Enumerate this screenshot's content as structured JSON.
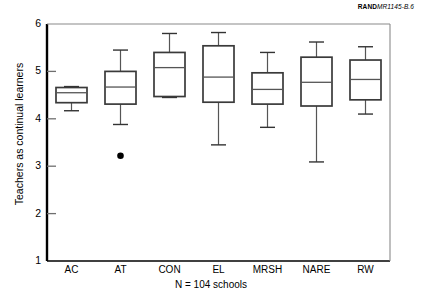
{
  "credit": {
    "brand": "RAND",
    "code": "MR1145-B.6"
  },
  "caption": "N = 104 schools",
  "chart_data": {
    "type": "box",
    "title": "",
    "xlabel": "",
    "ylabel": "Teachers as continual learners",
    "ylim": [
      1,
      6
    ],
    "yticks": [
      1,
      2,
      3,
      4,
      5,
      6
    ],
    "ytick_labels": [
      "1",
      "2",
      "3",
      "4",
      "5",
      "6"
    ],
    "grid": false,
    "legend": null,
    "categories": [
      "AC",
      "AT",
      "CON",
      "EL",
      "MRSH",
      "NARE",
      "RW"
    ],
    "boxes": [
      {
        "category": "AC",
        "whisker_low": 4.17,
        "q1": 4.34,
        "median": 4.55,
        "q3": 4.66,
        "whisker_high": 4.68,
        "outliers": []
      },
      {
        "category": "AT",
        "whisker_low": 3.88,
        "q1": 4.31,
        "median": 4.67,
        "q3": 5.0,
        "whisker_high": 5.45,
        "outliers": [
          3.22
        ]
      },
      {
        "category": "CON",
        "whisker_low": 4.45,
        "q1": 4.47,
        "median": 5.08,
        "q3": 5.4,
        "whisker_high": 5.8,
        "outliers": []
      },
      {
        "category": "EL",
        "whisker_low": 3.45,
        "q1": 4.35,
        "median": 4.88,
        "q3": 5.54,
        "whisker_high": 5.82,
        "outliers": []
      },
      {
        "category": "MRSH",
        "whisker_low": 3.82,
        "q1": 4.31,
        "median": 4.62,
        "q3": 4.97,
        "whisker_high": 5.4,
        "outliers": []
      },
      {
        "category": "NARE",
        "whisker_low": 3.09,
        "q1": 4.27,
        "median": 4.77,
        "q3": 5.3,
        "whisker_high": 5.62,
        "outliers": []
      },
      {
        "category": "RW",
        "whisker_low": 4.1,
        "q1": 4.4,
        "median": 4.83,
        "q3": 5.24,
        "whisker_high": 5.52,
        "outliers": []
      }
    ]
  }
}
